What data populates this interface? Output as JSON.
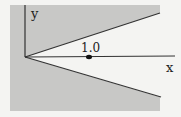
{
  "diagram": {
    "labels": {
      "y_axis": "y",
      "x_axis": "x",
      "point": "1.0"
    },
    "colors": {
      "background": "#f4f4f2",
      "shaded": "#c8c8c6",
      "wedge": "#f4f4f2",
      "line": "#333333"
    }
  }
}
